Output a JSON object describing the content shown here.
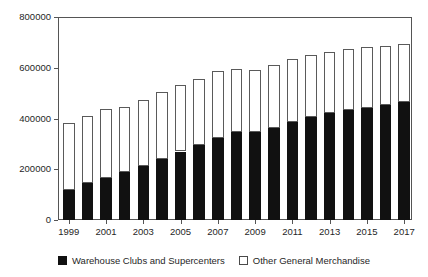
{
  "figure": {
    "cropped_title": "",
    "background": "#ffffff"
  },
  "legend": {
    "position": "bottom-center",
    "entries": [
      {
        "label": "Warehouse Clubs and Supercenters",
        "swatch": "filled-square-icon",
        "color": "#111111"
      },
      {
        "label": "Other General Merchandise",
        "swatch": "hollow-square-icon",
        "color": "#ffffff"
      }
    ]
  },
  "axes": {
    "y_ticks": [
      "0",
      "200000",
      "400000",
      "600000",
      "800000"
    ],
    "x_ticks": [
      "1999",
      "2001",
      "2003",
      "2005",
      "2007",
      "2009",
      "2011",
      "2013",
      "2015",
      "2017"
    ]
  },
  "chart_data": {
    "type": "bar",
    "stacked": true,
    "title": "",
    "xlabel": "",
    "ylabel": "",
    "ylim": [
      0,
      800000
    ],
    "yticks": [
      0,
      200000,
      400000,
      600000,
      800000
    ],
    "grid": false,
    "legend_position": "bottom-center",
    "categories": [
      "1999",
      "2000",
      "2001",
      "2002",
      "2003",
      "2004",
      "2005",
      "2006",
      "2007",
      "2008",
      "2009",
      "2010",
      "2011",
      "2012",
      "2013",
      "2014",
      "2015",
      "2016",
      "2017"
    ],
    "series": [
      {
        "name": "Warehouse Clubs and Supercenters",
        "color": "#111111",
        "values": [
          120000,
          145000,
          165000,
          190000,
          213000,
          240000,
          270000,
          295000,
          325000,
          345000,
          348000,
          362000,
          385000,
          405000,
          420000,
          435000,
          443000,
          452000,
          464000
        ]
      },
      {
        "name": "Other General Merchandise",
        "color": "#ffffff",
        "values": [
          261000,
          266000,
          273000,
          256000,
          260000,
          264000,
          264000,
          262000,
          261000,
          250000,
          245000,
          247000,
          248000,
          244000,
          244000,
          240000,
          237000,
          233000,
          228000
        ]
      }
    ],
    "totals": [
      381000,
      411000,
      438000,
      446000,
      473000,
      504000,
      534000,
      557000,
      586000,
      595000,
      593000,
      609000,
      633000,
      649000,
      664000,
      675000,
      680000,
      685000,
      692000
    ]
  }
}
